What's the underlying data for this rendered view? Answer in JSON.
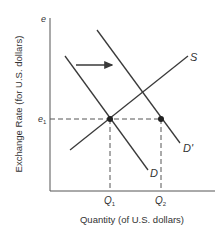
{
  "diagram": {
    "type": "supply-demand",
    "y_axis_label": "Exchange Rate (for U.S. dollars)",
    "x_axis_label": "Quantity (of U.S. dollars)",
    "y_axis_symbol": "e",
    "price_level_label": "e",
    "price_level_sub": "1",
    "q1_label": "Q",
    "q1_sub": "1",
    "q2_label": "Q",
    "q2_sub": "2",
    "curves": {
      "supply": "S",
      "demand": "D",
      "demand_shifted": "D'"
    },
    "shift_direction": "right",
    "colors": {
      "line": "#3a3a3a",
      "axis": "#555555",
      "text": "#333333"
    }
  }
}
